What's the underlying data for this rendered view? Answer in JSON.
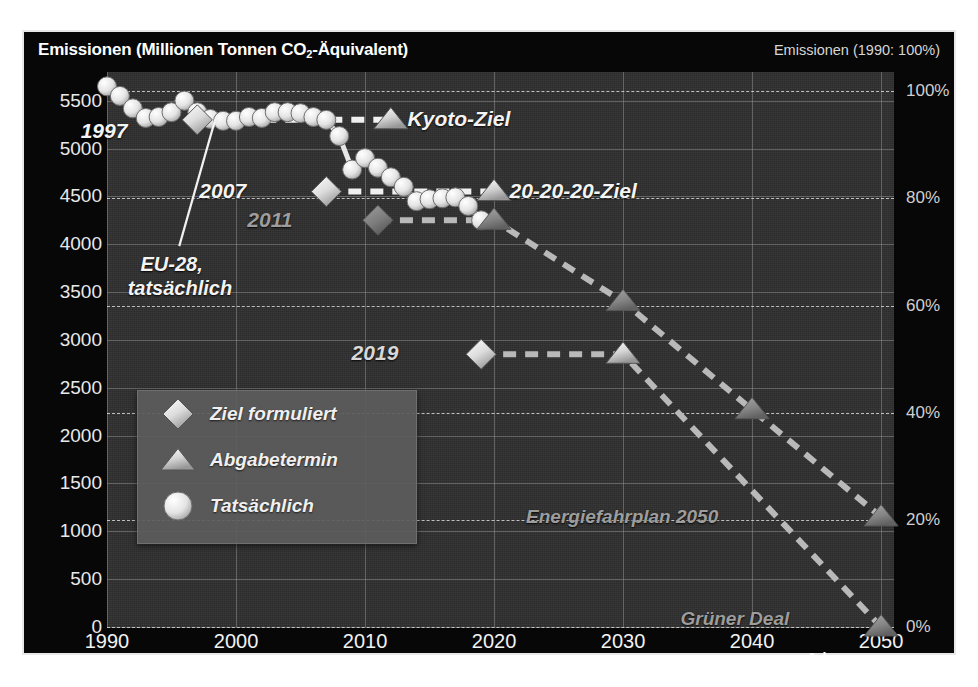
{
  "header": {
    "title_left_prefix": "Emissionen (Millionen Tonnen CO",
    "title_left_sub": "2",
    "title_left_suffix": "-Äquivalent)",
    "title_right": "Emissionen (1990: 100%)"
  },
  "axes": {
    "x_title": "Jahr",
    "x_ticks": [
      "1990",
      "2000",
      "2010",
      "2020",
      "2030",
      "2040",
      "2050"
    ],
    "x_tick_values": [
      1990,
      2000,
      2010,
      2020,
      2030,
      2040,
      2050
    ],
    "y_left_ticks": [
      "0",
      "500",
      "1000",
      "1500",
      "2000",
      "2500",
      "3000",
      "3500",
      "4000",
      "4500",
      "5000",
      "5500"
    ],
    "y_left_values": [
      0,
      500,
      1000,
      1500,
      2000,
      2500,
      3000,
      3500,
      4000,
      4500,
      5000,
      5500
    ],
    "y_right_ticks": [
      "0%",
      "20%",
      "40%",
      "60%",
      "80%",
      "100%"
    ],
    "y_right_values": [
      0,
      20,
      40,
      60,
      80,
      100
    ]
  },
  "legend": {
    "items": [
      {
        "marker": "diamond",
        "label": "Ziel formuliert"
      },
      {
        "marker": "triangle",
        "label": "Abgabetermin"
      },
      {
        "marker": "circle",
        "label": "Tatsächlich"
      }
    ]
  },
  "annotations": [
    {
      "name": "label-1997",
      "text": "1997",
      "tone": "bright"
    },
    {
      "name": "label-2007",
      "text": "2007",
      "tone": "bright"
    },
    {
      "name": "label-2011",
      "text": "2011",
      "tone": "dim"
    },
    {
      "name": "label-2019",
      "text": "2019",
      "tone": "mid"
    },
    {
      "name": "label-eu28",
      "text": "EU-28,",
      "tone": "bright"
    },
    {
      "name": "label-eu28-2",
      "text": "tatsächlich",
      "tone": "bright"
    },
    {
      "name": "label-kyoto",
      "text": "Kyoto-Ziel",
      "tone": "bright"
    },
    {
      "name": "label-202020",
      "text": "20-20-20-Ziel",
      "tone": "bright"
    },
    {
      "name": "label-energiefahrplan",
      "text": "Energiefahrplan 2050",
      "tone": "dim"
    },
    {
      "name": "label-gruener-deal",
      "text": "Grüner Deal",
      "tone": "dim"
    }
  ],
  "colors": {
    "panel_bg": "#070707",
    "plot_bg": "#2e2e2e",
    "gridline": "#8d8d8d",
    "pct_gridline": "#d8d8d8",
    "marker_bright": "#eeeeee",
    "marker_dim": "#8a8a8a",
    "text_bright": "#f4f4f4",
    "text_dim": "#9d9d9d"
  },
  "chart_data": {
    "type": "line",
    "title": "Emissionen (Millionen Tonnen CO2-Äquivalent)",
    "subtitle": "Emissionen (1990: 100%)",
    "xlabel": "Jahr",
    "ylabel": "Emissionen (Millionen Tonnen CO2-Äquivalent)",
    "ylabel_right": "Emissionen (1990: 100%)",
    "xlim": [
      1990,
      2051
    ],
    "ylim": [
      0,
      5800
    ],
    "ylim_right": [
      0,
      103.6
    ],
    "grid": true,
    "legend_position": "inside-lower-left",
    "series": [
      {
        "name": "EU-28, tatsächlich",
        "marker": "circle",
        "style": "solid-connected",
        "x": [
          1990,
          1991,
          1992,
          1993,
          1994,
          1995,
          1996,
          1997,
          1998,
          1999,
          2000,
          2001,
          2002,
          2003,
          2004,
          2005,
          2006,
          2007,
          2008,
          2009,
          2010,
          2011,
          2012,
          2013,
          2014,
          2015,
          2016,
          2017,
          2018,
          2019
        ],
        "values": [
          5650,
          5550,
          5420,
          5320,
          5330,
          5380,
          5500,
          5380,
          5310,
          5290,
          5290,
          5330,
          5320,
          5380,
          5380,
          5370,
          5330,
          5300,
          5130,
          4780,
          4900,
          4800,
          4700,
          4600,
          4450,
          4470,
          4480,
          4490,
          4400,
          4250
        ]
      },
      {
        "name": "Kyoto-Ziel",
        "marker_start": "diamond",
        "marker_end": "triangle",
        "style": "dashed",
        "year_formulated": 1997,
        "year_due": 2012,
        "x": [
          1997,
          2012
        ],
        "values": [
          5300,
          5300
        ]
      },
      {
        "name": "20-20-20-Ziel",
        "marker_start": "diamond",
        "marker_end": "triangle",
        "style": "dashed",
        "year_formulated": 2007,
        "year_due": 2020,
        "x": [
          2007,
          2020
        ],
        "values": [
          4550,
          4550
        ]
      },
      {
        "name": "Energiefahrplan 2050",
        "marker_start": "diamond",
        "marker_end": "triangle",
        "style": "dashed",
        "dim": true,
        "year_formulated": 2011,
        "x": [
          2011,
          2020,
          2030,
          2040,
          2050
        ],
        "values": [
          4250,
          4250,
          3400,
          2270,
          1150
        ]
      },
      {
        "name": "Grüner Deal",
        "marker_start": "diamond",
        "marker_end": "triangle",
        "style": "dashed",
        "year_formulated": 2019,
        "x": [
          2019,
          2030,
          2050
        ],
        "values": [
          2850,
          2850,
          0
        ]
      }
    ],
    "pct_reference_lines": [
      0,
      20,
      40,
      60,
      80,
      100
    ]
  }
}
